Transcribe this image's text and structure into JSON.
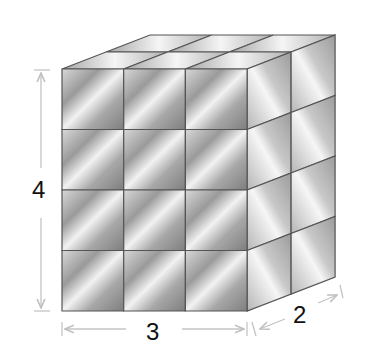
{
  "figure": {
    "type": "rectangular prism built from unit cubes",
    "dimensions": {
      "length": {
        "label": "3",
        "cubes": 3
      },
      "depth": {
        "label": "2",
        "cubes": 2
      },
      "height": {
        "label": "4",
        "cubes": 4
      }
    },
    "colors": {
      "edge": "#555555",
      "dimension_line": "#bfbfbf",
      "label": "#111111",
      "face_dark": "#8a8a8a",
      "face_light": "#f4f4f4"
    }
  }
}
